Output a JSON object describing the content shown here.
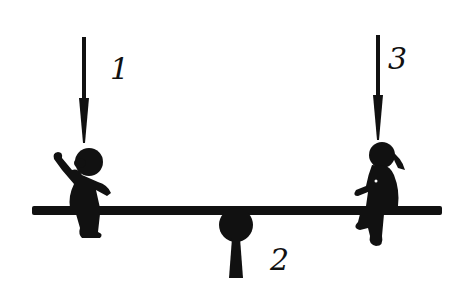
{
  "diagram": {
    "labels": [
      {
        "id": "1",
        "text": "1",
        "refers_to": "arrow above left child"
      },
      {
        "id": "2",
        "text": "2",
        "refers_to": "pivot / fulcrum"
      },
      {
        "id": "3",
        "text": "3",
        "refers_to": "arrow above right child"
      }
    ],
    "elements": {
      "beam": "seesaw-plank",
      "pivot": "fulcrum",
      "left_child": "boy-silhouette",
      "right_child": "girl-silhouette",
      "arrows": [
        "down-arrow-1",
        "down-arrow-3"
      ]
    },
    "colors": {
      "ink": "#111111",
      "background": "#ffffff"
    }
  }
}
